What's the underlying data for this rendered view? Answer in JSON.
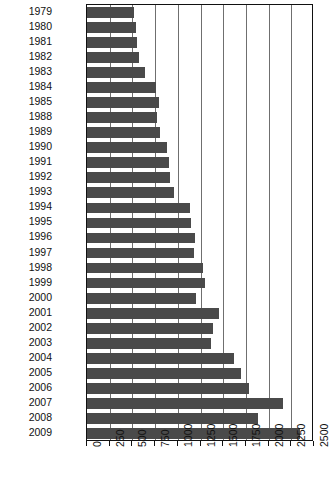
{
  "chart_data": {
    "type": "bar",
    "orientation": "horizontal",
    "title": "",
    "xlabel": "",
    "ylabel": "",
    "xlim": [
      0,
      2500
    ],
    "xticks": [
      0,
      250,
      500,
      750,
      1000,
      1250,
      1500,
      1750,
      2000,
      2250,
      2500
    ],
    "grid": true,
    "legend": null,
    "bar_color": "#4a4a4a",
    "axis_color": "#111111",
    "gridline_color": "#6f6f6f",
    "categories": [
      "1979",
      "1980",
      "1981",
      "1982",
      "1983",
      "1984",
      "1985",
      "1988",
      "1989",
      "1990",
      "1991",
      "1992",
      "1993",
      "1994",
      "1995",
      "1996",
      "1997",
      "1998",
      "1999",
      "2000",
      "2001",
      "2002",
      "2003",
      "2004",
      "2005",
      "2006",
      "2007",
      "2008",
      "2009"
    ],
    "values": [
      520,
      545,
      555,
      570,
      640,
      760,
      790,
      770,
      800,
      880,
      900,
      910,
      960,
      1130,
      1150,
      1190,
      1180,
      1280,
      1300,
      1200,
      1450,
      1390,
      1370,
      1620,
      1700,
      1780,
      2160,
      1880,
      2350
    ]
  }
}
